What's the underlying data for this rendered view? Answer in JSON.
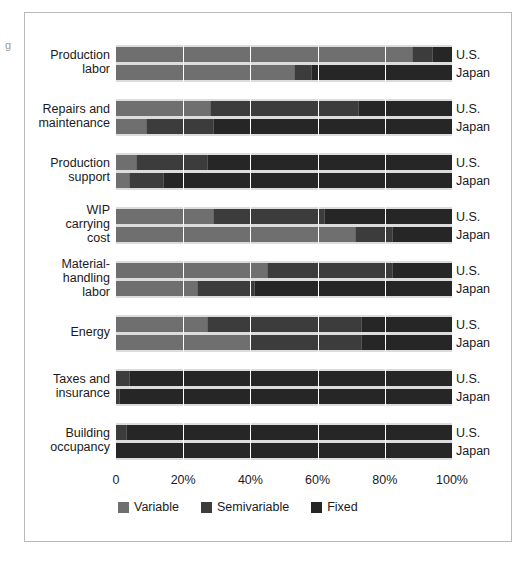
{
  "edge_mark": "g",
  "colors": {
    "variable": "#6f6f6f",
    "semivariable": "#3c3c3c",
    "fixed": "#262626",
    "band": "#dcdcdc",
    "gridline": "#ffffff",
    "frame": "#b9b9b9",
    "text": "#1a1a1a"
  },
  "legend": {
    "items": [
      {
        "label": "Variable",
        "key": "variable"
      },
      {
        "label": "Semivariable",
        "key": "semivariable"
      },
      {
        "label": "Fixed",
        "key": "fixed"
      }
    ]
  },
  "axis": {
    "ticks": [
      {
        "label": "0",
        "value": 0
      },
      {
        "label": "20%",
        "value": 20
      },
      {
        "label": "40%",
        "value": 40
      },
      {
        "label": "60%",
        "value": 60
      },
      {
        "label": "80%",
        "value": 80
      },
      {
        "label": "100%",
        "value": 100
      }
    ],
    "min": 0,
    "max": 100
  },
  "chart_data": {
    "type": "bar",
    "orientation": "horizontal",
    "stacked": true,
    "stacked_normalized": true,
    "title": "",
    "subtitle": "",
    "xlabel": "",
    "ylabel": "",
    "xlim": [
      0,
      100
    ],
    "xticks": [
      0,
      20,
      40,
      60,
      80,
      100
    ],
    "xticklabels": [
      "0",
      "20%",
      "40%",
      "60%",
      "80%",
      "100%"
    ],
    "grid": "vertical",
    "legend_position": "bottom-left",
    "legend_entries": [
      "Variable",
      "Semivariable",
      "Fixed"
    ],
    "categories": [
      "Production\nlabor",
      "Repairs and\nmaintenance",
      "Production\nsupport",
      "WIP\ncarrying\ncost",
      "Material-\nhandling\nlabor",
      "Energy",
      "Taxes and\ninsurance",
      "Building\noccupancy"
    ],
    "subgroups": [
      "U.S.",
      "Japan"
    ],
    "series": [
      {
        "name": "Variable",
        "color": "#6f6f6f"
      },
      {
        "name": "Semivariable",
        "color": "#3c3c3c"
      },
      {
        "name": "Fixed",
        "color": "#262626"
      }
    ],
    "groups": [
      {
        "category": "Production\nlabor",
        "rows": [
          {
            "subgroup": "U.S.",
            "variable": 88,
            "semivariable": 6,
            "fixed": 6
          },
          {
            "subgroup": "Japan",
            "variable": 53,
            "semivariable": 5,
            "fixed": 42
          }
        ]
      },
      {
        "category": "Repairs and\nmaintenance",
        "rows": [
          {
            "subgroup": "U.S.",
            "variable": 28,
            "semivariable": 44,
            "fixed": 28
          },
          {
            "subgroup": "Japan",
            "variable": 9,
            "semivariable": 20,
            "fixed": 71
          }
        ]
      },
      {
        "category": "Production\nsupport",
        "rows": [
          {
            "subgroup": "U.S.",
            "variable": 6,
            "semivariable": 21,
            "fixed": 73
          },
          {
            "subgroup": "Japan",
            "variable": 4,
            "semivariable": 10,
            "fixed": 86
          }
        ]
      },
      {
        "category": "WIP\ncarrying\ncost",
        "rows": [
          {
            "subgroup": "U.S.",
            "variable": 29,
            "semivariable": 33,
            "fixed": 38
          },
          {
            "subgroup": "Japan",
            "variable": 71,
            "semivariable": 11,
            "fixed": 18
          }
        ]
      },
      {
        "category": "Material-\nhandling\nlabor",
        "rows": [
          {
            "subgroup": "U.S.",
            "variable": 45,
            "semivariable": 37,
            "fixed": 18
          },
          {
            "subgroup": "Japan",
            "variable": 24,
            "semivariable": 17,
            "fixed": 59
          }
        ]
      },
      {
        "category": "Energy",
        "rows": [
          {
            "subgroup": "U.S.",
            "variable": 27,
            "semivariable": 46,
            "fixed": 27
          },
          {
            "subgroup": "Japan",
            "variable": 40,
            "semivariable": 33,
            "fixed": 27
          }
        ]
      },
      {
        "category": "Taxes and\ninsurance",
        "rows": [
          {
            "subgroup": "U.S.",
            "variable": 0,
            "semivariable": 4,
            "fixed": 96
          },
          {
            "subgroup": "Japan",
            "variable": 0,
            "semivariable": 1,
            "fixed": 99
          }
        ]
      },
      {
        "category": "Building\noccupancy",
        "rows": [
          {
            "subgroup": "U.S.",
            "variable": 0,
            "semivariable": 3,
            "fixed": 97
          },
          {
            "subgroup": "Japan",
            "variable": 0,
            "semivariable": 0,
            "fixed": 100
          }
        ]
      }
    ]
  }
}
